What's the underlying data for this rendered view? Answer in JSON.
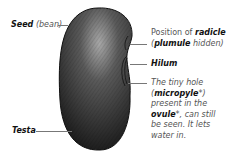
{
  "diagram": {
    "colors": {
      "seed_dark": "#2a2a2a",
      "seed_highlight": "#9a9a9a",
      "leader_line": "#777777",
      "label_text": "#111111",
      "sub_text": "#555555"
    },
    "labels": {
      "seed": {
        "term": "Seed",
        "note": "(bean)"
      },
      "radicle": {
        "prefix": "Position of ",
        "term": "radicle",
        "open": "(",
        "term2": "plumule",
        "suffix": " hidden)"
      },
      "hilum": {
        "term": "Hilum"
      },
      "micropyle": {
        "line1": "The tiny hole",
        "line2_open": "(",
        "line2_term": "micropyle",
        "line2_close": "*)",
        "line3": "present in the",
        "line4_term": "ovule",
        "line4_rest": "*, can still",
        "line5": "be seen. It lets",
        "line6": "water in."
      },
      "testa": {
        "term": "Testa"
      }
    }
  }
}
